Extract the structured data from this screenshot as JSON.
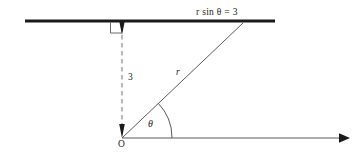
{
  "figure": {
    "type": "polar-geometry-diagram",
    "background_color": "#ffffff",
    "stroke_color": "#1a1a1a",
    "thin_stroke_color": "#555555",
    "labels": {
      "equation": "r sin θ = 3",
      "radius": "r",
      "height": "3",
      "angle": "θ",
      "origin": "O"
    },
    "geometry": {
      "origin": {
        "x": 122,
        "y": 138
      },
      "thick_line": {
        "x1": 25,
        "y1": 21,
        "x2": 275,
        "y2": 21
      },
      "dashed_vertical": {
        "x1": 122,
        "y1": 26,
        "x2": 122,
        "y2": 132
      },
      "radius_ray": {
        "x1": 122,
        "y1": 138,
        "x2": 243,
        "y2": 23
      },
      "polar_axis": {
        "x1": 122,
        "y1": 138,
        "x2": 345,
        "y2": 138
      },
      "right_angle_marker": {
        "x": 110,
        "y": 22,
        "size": 11
      },
      "angle_arc_radius": 50,
      "angle_degrees": 44
    },
    "label_positions": {
      "equation": {
        "left": 196,
        "top": 8
      },
      "radius": {
        "left": 176,
        "top": 68
      },
      "height": {
        "left": 128,
        "top": 73
      },
      "angle": {
        "left": 148,
        "top": 119
      },
      "origin": {
        "left": 118,
        "top": 140
      }
    }
  }
}
